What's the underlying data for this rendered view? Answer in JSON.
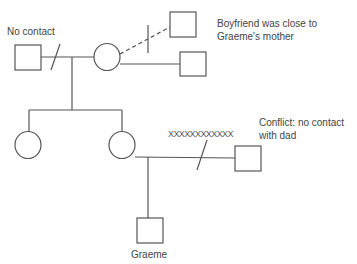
{
  "diagram": {
    "type": "genogram",
    "stroke_color": "#555555",
    "labels": {
      "no_contact": "No contact",
      "boyfriend_note_line1": "Boyfriend was close to",
      "boyfriend_note_line2": "Graeme's mother",
      "conflict_note_line1": "Conflict: no contact",
      "conflict_note_line2": "with dad",
      "conflict_marker": "XXXXXXXXXXXX",
      "child_name": "Graeme"
    },
    "nodes": [
      {
        "id": "grandfather",
        "shape": "square",
        "note": "No contact"
      },
      {
        "id": "grandmother",
        "shape": "circle"
      },
      {
        "id": "boyfriend",
        "shape": "square",
        "relation": "dashed, ended"
      },
      {
        "id": "grandmother-partner",
        "shape": "square"
      },
      {
        "id": "aunt",
        "shape": "circle"
      },
      {
        "id": "mother",
        "shape": "circle"
      },
      {
        "id": "dad",
        "shape": "square",
        "relation": "conflict, separated"
      },
      {
        "id": "graeme",
        "shape": "square",
        "name": "Graeme"
      }
    ],
    "edges": [
      {
        "from": "grandfather",
        "to": "grandmother",
        "type": "separated"
      },
      {
        "from": "grandmother",
        "to": "boyfriend",
        "type": "dashed-ended"
      },
      {
        "from": "grandmother",
        "to": "grandmother-partner",
        "type": "partnership"
      },
      {
        "from": "grandparents",
        "to": "aunt",
        "type": "child"
      },
      {
        "from": "grandparents",
        "to": "mother",
        "type": "child"
      },
      {
        "from": "mother",
        "to": "dad",
        "type": "conflict-separated"
      },
      {
        "from": "mother-dad",
        "to": "graeme",
        "type": "child"
      }
    ]
  }
}
